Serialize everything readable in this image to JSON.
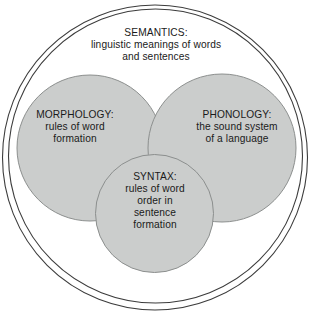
{
  "diagram": {
    "name": "components-of-language-venn-diagram",
    "type": "venn",
    "caption_top_cropped": "",
    "outer_ring": {
      "name": "language-outer-boundary",
      "label": ""
    },
    "semantics": {
      "title": "SEMANTICS:",
      "line1": "linguistic meanings of words",
      "line2": "and sentences"
    },
    "morphology": {
      "title": "MORPHOLOGY:",
      "line1": "rules of word",
      "line2": "formation"
    },
    "phonology": {
      "title": "PHONOLOGY:",
      "line1": "the sound system",
      "line2": "of a language"
    },
    "syntax": {
      "title": "SYNTAX:",
      "line1": "rules of word",
      "line2": "order in",
      "line3": "sentence",
      "line4": "formation"
    },
    "colors": {
      "background": "#ffffff",
      "circle_fill": "#cbcdcc",
      "circle_stroke": "#8c8f8e",
      "outer_stroke": "#3c3c3c",
      "text": "#1a1a1a"
    }
  }
}
